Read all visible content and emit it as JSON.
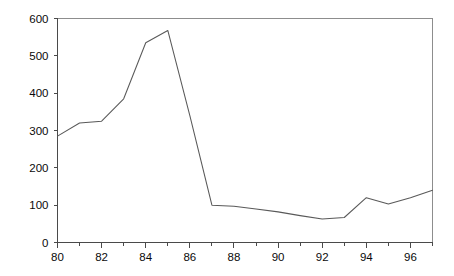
{
  "chart_data": {
    "type": "line",
    "title": "",
    "subtitle": "",
    "xlabel": "",
    "ylabel": "",
    "x": [
      80,
      81,
      82,
      83,
      84,
      85,
      86,
      87,
      88,
      89,
      90,
      91,
      92,
      93,
      94,
      95,
      96,
      97
    ],
    "values": [
      285,
      320,
      325,
      385,
      535,
      568,
      340,
      100,
      97,
      90,
      82,
      72,
      63,
      67,
      120,
      103,
      120,
      140
    ],
    "series": [
      {
        "name": "series-1",
        "values": [
          285,
          320,
          325,
          385,
          535,
          568,
          340,
          100,
          97,
          90,
          82,
          72,
          63,
          67,
          120,
          103,
          120,
          140
        ]
      }
    ],
    "xlim": [
      80,
      97
    ],
    "ylim": [
      0,
      600
    ],
    "x_ticks": [
      80,
      81,
      82,
      83,
      84,
      85,
      86,
      87,
      88,
      89,
      90,
      91,
      92,
      93,
      94,
      95,
      96,
      97
    ],
    "x_tick_labels": [
      "80",
      "",
      "82",
      "",
      "84",
      "",
      "86",
      "",
      "88",
      "",
      "90",
      "",
      "92",
      "",
      "94",
      "",
      "96",
      ""
    ],
    "x_labeled_ticks": [
      "80",
      "82",
      "84",
      "86",
      "88",
      "90",
      "92",
      "94",
      "96"
    ],
    "y_ticks": [
      0,
      100,
      200,
      300,
      400,
      500,
      600
    ],
    "y_tick_labels": [
      "0",
      "100",
      "200",
      "300",
      "400",
      "500",
      "600"
    ],
    "grid": false,
    "legend": false,
    "legend_position": "none",
    "annotations": []
  },
  "style": {
    "line_color": "#595959",
    "axis_color": "#4a4a4a",
    "frame_color": "#8d8d8d",
    "text_color": "#0a0a0a",
    "background_color": "#ffffff"
  }
}
